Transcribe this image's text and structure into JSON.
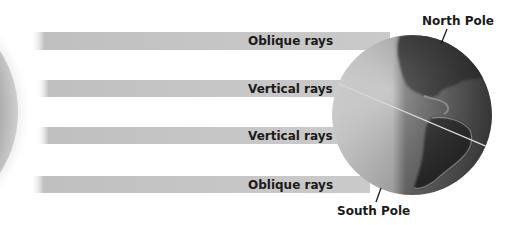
{
  "diagram": {
    "title": "",
    "sun": {
      "label": "",
      "color": "#a8a8a8"
    },
    "rays": [
      {
        "label": "Oblique rays",
        "y": 32,
        "h": 18
      },
      {
        "label": "Vertical rays",
        "y": 80,
        "h": 17
      },
      {
        "label": "Vertical rays",
        "y": 127,
        "h": 17
      },
      {
        "label": "Oblique rays",
        "y": 176,
        "h": 17
      }
    ],
    "globe": {
      "center_x": 412,
      "center_y": 115,
      "radius": 80,
      "equator": "tilted"
    },
    "poles": {
      "north": "North Pole",
      "south": "South Pole"
    },
    "colors": {
      "ray": "#c4c4c4",
      "globe_light": "#d6d6d6",
      "globe_dark": "#4a4a4a",
      "land": "#262626",
      "text": "#1a1a1a"
    }
  }
}
